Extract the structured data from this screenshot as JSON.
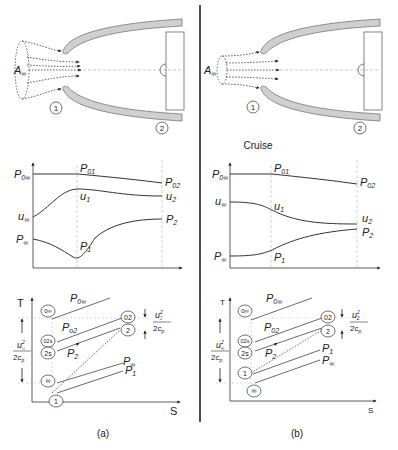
{
  "figure": {
    "divider_color": "#222222",
    "duct_fill": "#cfcfd2",
    "duct_stroke": "#777777",
    "guide_color": "#b9b9b9"
  },
  "panel_a": {
    "caption": "(a)",
    "intake": {
      "capture_area_label": "A",
      "capture_area_sub": "∞",
      "station_1": "1",
      "station_2": "2"
    },
    "profile_chart": {
      "labels": {
        "P0inf": "P",
        "P0inf_sub": "0∞",
        "P01": "P",
        "P01_sub": "01",
        "P02": "P",
        "P02_sub": "02",
        "uinf": "u",
        "uinf_sub": "∞",
        "u1": "u",
        "u1_sub": "1",
        "u2": "u",
        "u2_sub": "2",
        "Pinf": "P",
        "Pinf_sub": "∞",
        "P1": "P",
        "P1_sub": "1",
        "P2": "P",
        "P2_sub": "2"
      }
    },
    "ts_chart": {
      "y_axis": "T",
      "x_axis": "S",
      "states": [
        "0∞",
        "02s",
        "2s",
        "∞",
        "1",
        "02",
        "2"
      ],
      "isobars": {
        "P0inf": "P",
        "P0inf_sub": "0∞",
        "P02": "P",
        "P02_sub": "o2",
        "P2": "P",
        "P2_sub": "2",
        "Pinf": "P",
        "Pinf_sub": "∞",
        "P1": "P",
        "P1_sub": "1"
      },
      "left_bracket": {
        "num": "u",
        "num_sub": "∞",
        "num_sup": "2",
        "den": "2c",
        "den_sub": "p"
      },
      "right_bracket": {
        "num": "u",
        "num_sub": "2",
        "num_sup": "2",
        "den": "2c",
        "den_sub": "p"
      }
    }
  },
  "panel_b": {
    "caption": "(b)",
    "title": "Cruise",
    "intake": {
      "capture_area_label": "A",
      "capture_area_sub": "∞",
      "station_1": "1",
      "station_2": "2"
    },
    "profile_chart": {
      "labels": {
        "P0inf": "P",
        "P0inf_sub": "0∞",
        "P01": "P",
        "P01_sub": "01",
        "P02": "P",
        "P02_sub": "02",
        "uinf": "u",
        "uinf_sub": "∞",
        "u1": "u",
        "u1_sub": "1",
        "u2": "u",
        "u2_sub": "2",
        "Pinf": "P",
        "Pinf_sub": "∞",
        "P1": "P",
        "P1_sub": "1",
        "P2": "P",
        "P2_sub": "2"
      }
    },
    "ts_chart": {
      "y_axis": "T",
      "x_axis": "S",
      "states": [
        "0∞",
        "02s",
        "2s",
        "1",
        "∞",
        "02",
        "2"
      ],
      "isobars": {
        "P0inf": "P",
        "P0inf_sub": "0∞",
        "P02": "P",
        "P02_sub": "02",
        "P2": "P",
        "P2_sub": "2",
        "P1": "P",
        "P1_sub": "1",
        "Pinf": "P",
        "Pinf_sub": "∞"
      },
      "left_bracket": {
        "num": "u",
        "num_sub": "∞",
        "num_sup": "2",
        "den": "2c",
        "den_sub": "p"
      },
      "right_bracket": {
        "num": "u",
        "num_sub": "2",
        "num_sup": "2",
        "den": "2c",
        "den_sub": "p"
      }
    }
  }
}
